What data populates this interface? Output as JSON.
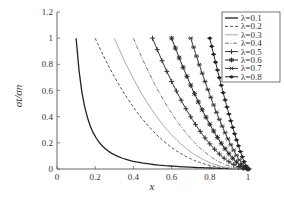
{
  "chart_data": {
    "type": "line",
    "title": "",
    "xlabel": "x",
    "ylabel": "σt/σn",
    "xlim": [
      0,
      1
    ],
    "ylim": [
      0,
      1.2
    ],
    "grid": false,
    "legend_position": "top-right",
    "x_ticks": [
      "0",
      "0.2",
      "0.4",
      "0.6",
      "0.8",
      "1"
    ],
    "y_ticks": [
      "0",
      "0.2",
      "0.4",
      "0.6",
      "0.8",
      "1",
      "1.2"
    ],
    "series": [
      {
        "name": "λ=0.1",
        "style": "solid",
        "color": "#222222",
        "marker": "none",
        "x": [
          0.1,
          0.12,
          0.15,
          0.2,
          0.25,
          0.3,
          0.4,
          0.5,
          0.6,
          0.7,
          0.8,
          0.9,
          1.0
        ],
        "y": [
          1.0,
          0.69,
          0.44,
          0.25,
          0.16,
          0.11,
          0.06,
          0.04,
          0.03,
          0.02,
          0.01,
          0.01,
          0.0
        ]
      },
      {
        "name": "λ=0.2",
        "style": "dashed",
        "color": "#555555",
        "marker": "none",
        "x": [
          0.2,
          0.3,
          0.4,
          0.5,
          0.6,
          0.7,
          0.8,
          0.9,
          1.0
        ],
        "y": [
          1.0,
          0.71,
          0.47,
          0.29,
          0.16,
          0.08,
          0.03,
          0.01,
          0.0
        ]
      },
      {
        "name": "λ=0.3",
        "style": "solid",
        "color": "#aaaaaa",
        "marker": "none",
        "x": [
          0.3,
          0.4,
          0.5,
          0.6,
          0.7,
          0.8,
          0.9,
          1.0
        ],
        "y": [
          1.0,
          0.7,
          0.46,
          0.28,
          0.15,
          0.07,
          0.02,
          0.0
        ]
      },
      {
        "name": "λ=0.4",
        "style": "dashdot",
        "color": "#777777",
        "marker": "none",
        "x": [
          0.4,
          0.5,
          0.6,
          0.7,
          0.8,
          0.9,
          1.0
        ],
        "y": [
          1.0,
          0.72,
          0.48,
          0.29,
          0.15,
          0.05,
          0.0
        ]
      },
      {
        "name": "λ=0.5",
        "style": "solid",
        "color": "#333333",
        "marker": "plus",
        "x": [
          0.5,
          0.6,
          0.7,
          0.8,
          0.9,
          1.0
        ],
        "y": [
          1.0,
          0.73,
          0.49,
          0.29,
          0.12,
          0.0
        ]
      },
      {
        "name": "λ=0.6",
        "style": "solid",
        "color": "#222222",
        "marker": "star",
        "x": [
          0.6,
          0.7,
          0.8,
          0.9,
          1.0
        ],
        "y": [
          1.0,
          0.7,
          0.44,
          0.21,
          0.0
        ]
      },
      {
        "name": "λ=0.7",
        "style": "solid",
        "color": "#333333",
        "marker": "cross-x",
        "x": [
          0.7,
          0.8,
          0.9,
          1.0
        ],
        "y": [
          1.0,
          0.61,
          0.28,
          0.0
        ]
      },
      {
        "name": "λ=0.8",
        "style": "solid",
        "color": "#222222",
        "marker": "dot",
        "x": [
          0.8,
          0.85,
          0.9,
          0.95,
          1.0
        ],
        "y": [
          1.0,
          0.7,
          0.42,
          0.18,
          0.0
        ]
      }
    ]
  }
}
